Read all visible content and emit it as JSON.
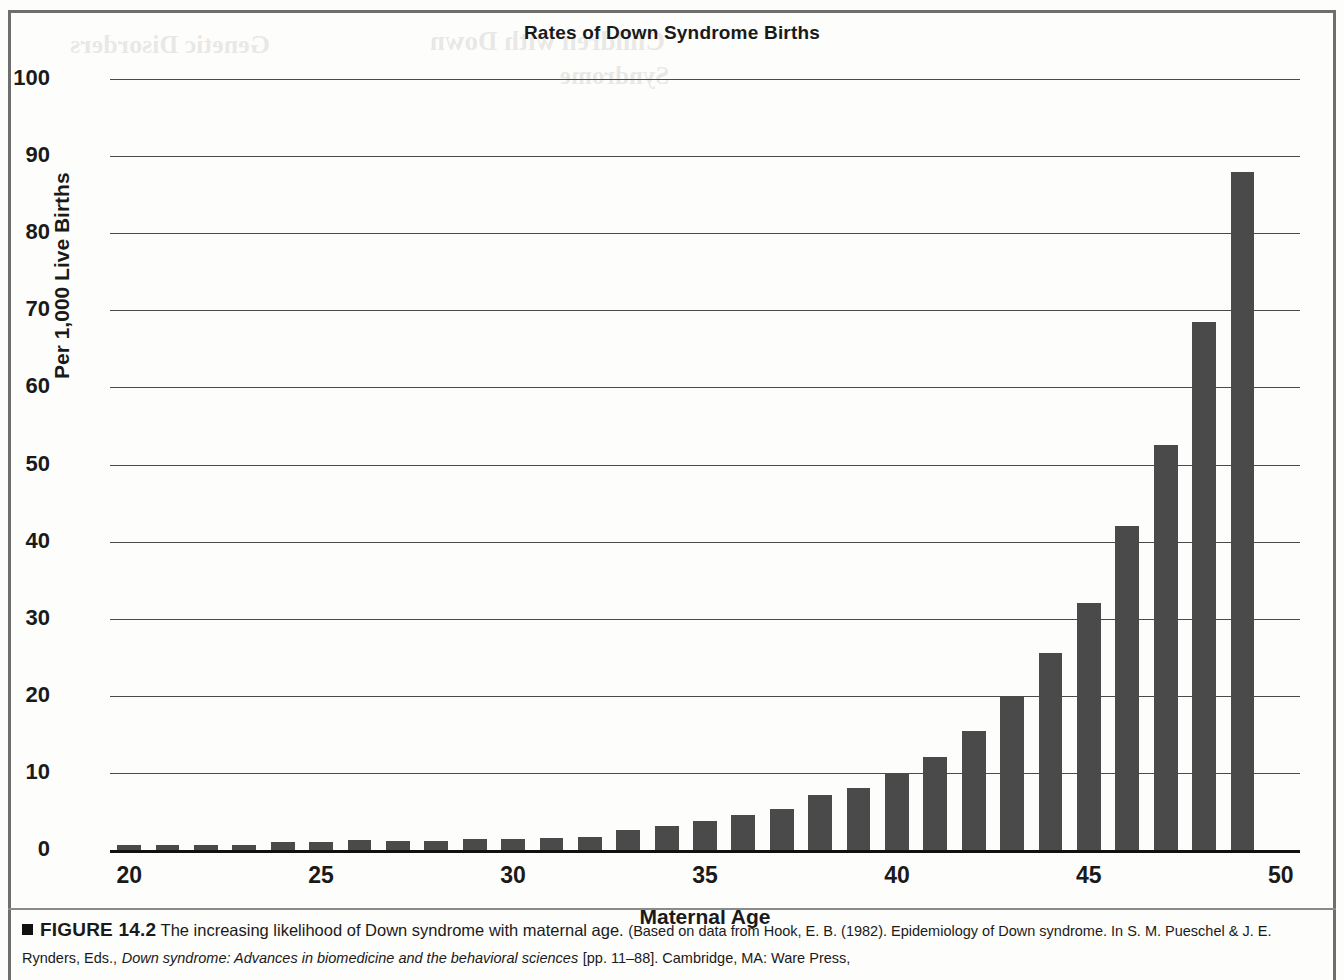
{
  "figure": {
    "number_label": "FIGURE 14.2",
    "caption_main": "The increasing likelihood of Down syndrome with maternal age.",
    "source_part1": "(Based on data from Hook, E. B. (1982). Epidemiology of Down syndrome. In S. M. Pueschel & J. E. Rynders, Eds.,",
    "source_italic": "Down syndrome: Advances in biomedicine and the behavioral sciences",
    "source_part2": "[pp. 11–88]. Cambridge, MA: Ware Press,"
  },
  "ghost_text": {
    "line1": "Genetic Disorders",
    "line2": "Children with Down",
    "line3": "Syndrome"
  },
  "chart_data": {
    "type": "bar",
    "title": "Rates of Down Syndrome Births",
    "xlabel": "Maternal Age",
    "ylabel": "Per 1,000 Live Births",
    "ylim": [
      0,
      100
    ],
    "ytick_values": [
      0,
      10,
      20,
      30,
      40,
      50,
      60,
      70,
      80,
      90,
      100
    ],
    "ytick_labels": [
      "0",
      "10",
      "20",
      "30",
      "40",
      "50",
      "60",
      "70",
      "80",
      "90",
      "100"
    ],
    "xtick_values": [
      20,
      25,
      30,
      35,
      40,
      45,
      50
    ],
    "xtick_labels": [
      "20",
      "25",
      "30",
      "35",
      "40",
      "45",
      "50"
    ],
    "xlim": [
      19.5,
      50.5
    ],
    "grid": "horizontal",
    "legend": "none",
    "bar_color": "#4a4a4a",
    "categories": [
      20,
      21,
      22,
      23,
      24,
      25,
      26,
      27,
      28,
      29,
      30,
      31,
      32,
      33,
      34,
      35,
      36,
      37,
      38,
      39,
      40,
      41,
      42,
      43,
      44,
      45,
      46,
      47,
      48,
      49
    ],
    "values": [
      0.6,
      0.6,
      0.6,
      0.7,
      1.0,
      1.1,
      1.3,
      1.2,
      1.2,
      1.4,
      1.4,
      1.5,
      1.7,
      2.6,
      3.1,
      3.8,
      4.6,
      5.3,
      7.1,
      8.0,
      9.8,
      12.0,
      15.4,
      19.9,
      25.5,
      32.0,
      42.0,
      52.5,
      68.5,
      88.0
    ]
  }
}
